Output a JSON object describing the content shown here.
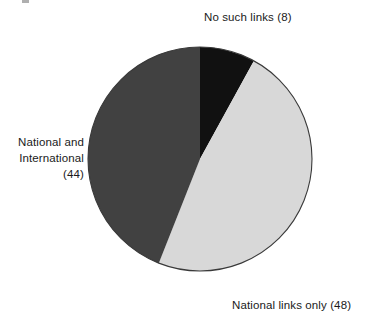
{
  "chart_data": {
    "type": "pie",
    "title": "",
    "subtitle": "",
    "xlabel": "",
    "ylabel": "",
    "legend_position": "none",
    "grid": false,
    "total": 100,
    "start_angle_deg": 0,
    "direction": "clockwise",
    "categories": [
      "No such links",
      "National links only",
      "National and International"
    ],
    "values": [
      8,
      48,
      44
    ],
    "slices": [
      {
        "label": "No such links",
        "value": 8,
        "value_text": "(8)",
        "display_text": "No such links (8)",
        "color": "#111111",
        "start_angle_deg": 0,
        "end_angle_deg": 28.8,
        "percent": 8
      },
      {
        "label": "National links only",
        "value": 48,
        "value_text": "(48)",
        "display_text": "National links only (48)",
        "color": "#d8d8d8",
        "start_angle_deg": 28.8,
        "end_angle_deg": 201.6,
        "percent": 48
      },
      {
        "label": "National and International",
        "value": 44,
        "value_text": "(44)",
        "display_text": "National and International (44)",
        "label_line_1": "National and",
        "label_line_2": "International",
        "label_line_3": "(44)",
        "color": "#414141",
        "start_angle_deg": 201.6,
        "end_angle_deg": 360,
        "percent": 44
      }
    ]
  },
  "labels": {
    "top": "No such links (8)",
    "left_line_1": "National and",
    "left_line_2": "International",
    "left_line_3": "(44)",
    "bottom_right": "National links only (48)"
  },
  "style": {
    "background": "#ffffff",
    "text_color": "#1a1a1a",
    "outline_color": "#3a3a3a",
    "slice_black": "#111111",
    "slice_light_gray": "#d8d8d8",
    "slice_dark_gray": "#414141"
  },
  "geometry": {
    "center_x": 200,
    "center_y": 159,
    "radius": 112
  }
}
